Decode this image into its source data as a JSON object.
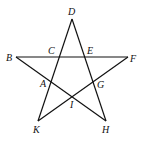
{
  "diagram": {
    "type": "pentagram",
    "points": {
      "D": "D",
      "B": "B",
      "C": "C",
      "E": "E",
      "F": "F",
      "A": "A",
      "G": "G",
      "I": "I",
      "K": "K",
      "H": "H"
    },
    "segments": [
      [
        "D",
        "K"
      ],
      [
        "D",
        "H"
      ],
      [
        "B",
        "F"
      ],
      [
        "B",
        "H"
      ],
      [
        "F",
        "K"
      ]
    ]
  }
}
